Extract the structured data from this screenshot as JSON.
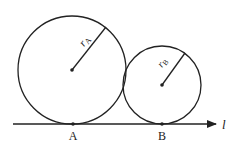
{
  "diagram": {
    "circles": [
      {
        "name": "A",
        "cx": 72,
        "cy": 70,
        "r": 54,
        "radius_label": "r",
        "radius_sub": "A",
        "point_label": "A"
      },
      {
        "name": "B",
        "cx": 162,
        "cy": 85,
        "r": 39,
        "radius_label": "r",
        "radius_sub": "B",
        "point_label": "B"
      }
    ],
    "line": {
      "label": "l",
      "y": 124,
      "x1": 13,
      "x2": 216
    },
    "colors": {
      "stroke": "#222222",
      "background": "#ffffff"
    }
  }
}
